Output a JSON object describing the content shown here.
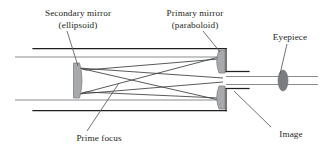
{
  "figure": {
    "background_color": "#ffffff",
    "width": 325,
    "height": 155
  },
  "labels": {
    "secondary_mirror": "Secondary mirror\n(ellipsoid)",
    "primary_mirror": "Primary mirror\n(paraboloid)",
    "eyepiece": "Eyepiece",
    "prime_focus": "Prime focus",
    "image": "Image"
  },
  "colors": {
    "text": "#231f20",
    "tube_stroke": "#231f20",
    "ray_stroke": "#808285",
    "mirror_fill": "#a7a9ac",
    "mirror_stroke": "#808285",
    "eyepiece_fill": "#7a7c7f",
    "leader_stroke": "#58595b"
  },
  "components": [
    {
      "name": "telescope-tube",
      "type": "outline"
    },
    {
      "name": "secondary-mirror",
      "type": "mirror",
      "shape": "concave-ellipsoid",
      "position": "left"
    },
    {
      "name": "primary-mirror-upper",
      "type": "mirror",
      "shape": "concave-paraboloid",
      "position": "right-top"
    },
    {
      "name": "primary-mirror-lower",
      "type": "mirror",
      "shape": "concave-paraboloid",
      "position": "right-bottom"
    },
    {
      "name": "eyepiece-lens",
      "type": "lens",
      "shape": "ellipse",
      "position": "far-right"
    },
    {
      "name": "incoming-rays",
      "type": "rays",
      "count": 4
    },
    {
      "name": "reflected-rays",
      "type": "rays",
      "count": 4
    }
  ],
  "leaders": [
    {
      "name": "secondary-mirror-leader",
      "from_label": "secondary_mirror",
      "to_component": "secondary-mirror"
    },
    {
      "name": "primary-mirror-leader",
      "from_label": "primary_mirror",
      "to_component": "primary-mirror-upper"
    },
    {
      "name": "eyepiece-leader",
      "from_label": "eyepiece",
      "to_component": "eyepiece-lens"
    },
    {
      "name": "prime-focus-leader",
      "from_label": "prime_focus",
      "to_component": "prime-focus-point"
    },
    {
      "name": "image-leader",
      "from_label": "image",
      "to_component": "image-point"
    }
  ]
}
